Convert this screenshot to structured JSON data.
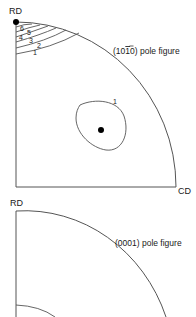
{
  "figures": [
    {
      "title": "(10̅1̅0) pole figure",
      "title_plain": "(1010) pole figure",
      "title_parts": {
        "open": "(",
        "d1": "1",
        "d2": "0",
        "d3_bar": "1",
        "d4": "0",
        "close": ")",
        "suffix": " pole figure"
      },
      "axis_top": "RD",
      "axis_right": "CD",
      "contour_labels": [
        "6",
        "5",
        "4",
        "3",
        "2",
        "1"
      ],
      "peak_contour_label": "1"
    },
    {
      "title": "(0001) pole figure",
      "axis_top": "RD"
    }
  ],
  "colors": {
    "line": "#555555",
    "text": "#1a1a1a",
    "dot": "#000000",
    "background": "#ffffff"
  }
}
